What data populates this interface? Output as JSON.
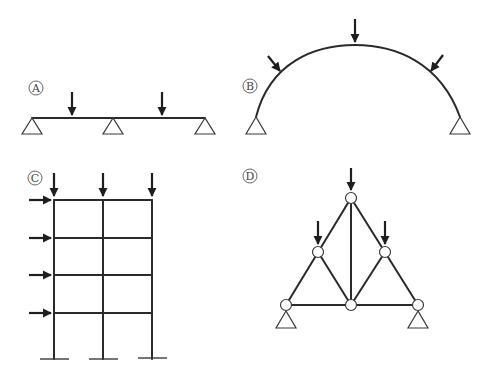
{
  "diagrams": [
    {
      "id": "A",
      "label": "A",
      "type": "continuous-beam",
      "supports": 3,
      "point_loads": 2,
      "load_direction": "vertical-down"
    },
    {
      "id": "B",
      "label": "B",
      "type": "arch",
      "supports": 2,
      "point_loads": 3,
      "load_direction": "radial-inward"
    },
    {
      "id": "C",
      "label": "C",
      "type": "multi-storey-frame",
      "bays": 2,
      "storeys": 4,
      "vertical_loads": 3,
      "horizontal_loads": 4,
      "base": "fixed"
    },
    {
      "id": "D",
      "label": "D",
      "type": "truss",
      "joints": 6,
      "supports": 2,
      "point_loads": 3,
      "load_direction": "vertical-down"
    }
  ],
  "colors": {
    "line": "#2a2a2a",
    "background": "#ffffff"
  }
}
